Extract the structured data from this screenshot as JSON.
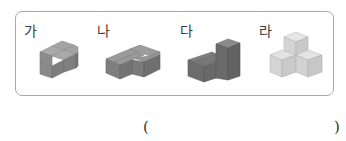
{
  "question": {
    "options": [
      {
        "label": "가",
        "shape": "l-shaped block of 4 cubes with one stacked",
        "color": "#8a8a8a"
      },
      {
        "label": "나",
        "shape": "t-shaped block of 4 cubes flat",
        "color": "#7a7a7a"
      },
      {
        "label": "다",
        "shape": "step block with tall column",
        "color": "#6e6e6e"
      },
      {
        "label": "라",
        "shape": "three cubes pyramid",
        "color": "#d6d6d6"
      }
    ],
    "answer_open": "(",
    "answer_close": ")"
  }
}
